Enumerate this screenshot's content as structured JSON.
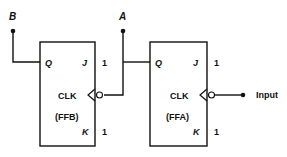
{
  "diagram": {
    "type": "two-stage JK flip-flop counter",
    "outputs": {
      "b_label": "B",
      "a_label": "A"
    },
    "input_label": "Input",
    "flipflops": [
      {
        "name": "(FFB)",
        "q": "Q",
        "j": "J",
        "k": "K",
        "clk": "CLK",
        "j_value": "1",
        "k_value": "1"
      },
      {
        "name": "(FFA)",
        "q": "Q",
        "j": "J",
        "k": "K",
        "clk": "CLK",
        "j_value": "1",
        "k_value": "1"
      }
    ],
    "line_color": "#111111"
  }
}
